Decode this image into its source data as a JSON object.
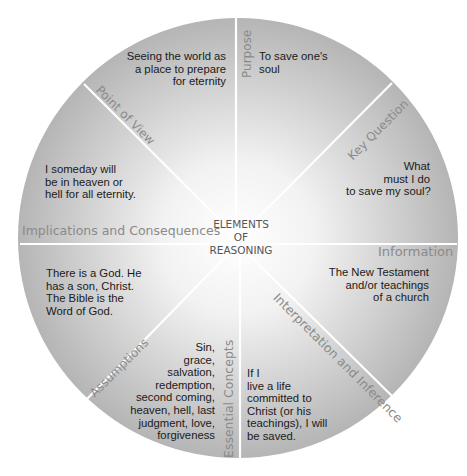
{
  "center": {
    "line1": "ELEMENTS",
    "line2": "OF",
    "line3": "REASONING"
  },
  "segments": [
    {
      "id": "purpose",
      "label": "Purpose",
      "text": "To save one's\nsoul"
    },
    {
      "id": "key-question",
      "label": "Key Question",
      "text": "What\nmust I do\nto save my soul?"
    },
    {
      "id": "information",
      "label": "Information",
      "text": "The New Testament\nand/or teachings\nof a church"
    },
    {
      "id": "interpretation-inference",
      "label": "Interpretation and Inference",
      "text": "If I\nlive a life\ncommitted to\nChrist (or his\nteachings), I will\nbe saved."
    },
    {
      "id": "essential-concepts",
      "label": "Essential Concepts",
      "text": "Sin,\ngrace,\nsalvation,\nredemption,\nsecond coming,\nheaven, hell, last\njudgment, love,\nforgiveness"
    },
    {
      "id": "assumptions",
      "label": "Assumptions",
      "text": "There is a God. He\nhas a son, Christ.\nThe Bible is the\nWord of God."
    },
    {
      "id": "implications-consequences",
      "label": "Implications and Consequences",
      "text": "I someday will\nbe in heaven or\nhell for all eternity."
    },
    {
      "id": "point-of-view",
      "label": "Point of View",
      "text": "Seeing the world as\na place to prepare\nfor eternity"
    }
  ],
  "colors": {
    "wheel_edge": "#b3b3b3",
    "wheel_center": "#ffffff",
    "divider": "#ffffff",
    "label": "#8a8a8a",
    "body_text": "#1a1a1a"
  }
}
